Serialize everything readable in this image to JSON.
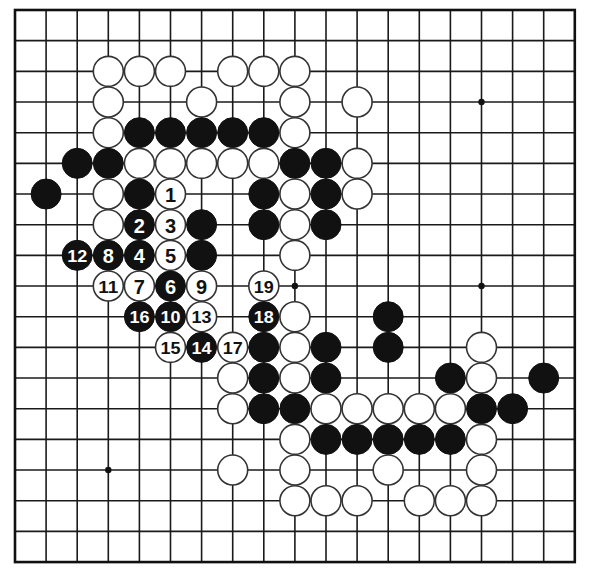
{
  "board": {
    "size": 19,
    "origin_x": 15,
    "origin_y": 10,
    "spacing_x": 31.1,
    "spacing_y": 30.67,
    "stone_radius": 15,
    "colors": {
      "black": "#111111",
      "white": "#ffffff",
      "line": "#1a1a1a",
      "background": "#ffffff"
    },
    "star_points": [
      [
        3,
        3
      ],
      [
        9,
        3
      ],
      [
        15,
        3
      ],
      [
        3,
        9
      ],
      [
        9,
        9
      ],
      [
        15,
        9
      ],
      [
        3,
        15
      ],
      [
        9,
        15
      ],
      [
        15,
        15
      ]
    ]
  },
  "stones": [
    {
      "c": 3,
      "r": 2,
      "color": "white"
    },
    {
      "c": 4,
      "r": 2,
      "color": "white"
    },
    {
      "c": 5,
      "r": 2,
      "color": "white"
    },
    {
      "c": 7,
      "r": 2,
      "color": "white"
    },
    {
      "c": 8,
      "r": 2,
      "color": "white"
    },
    {
      "c": 9,
      "r": 2,
      "color": "white"
    },
    {
      "c": 3,
      "r": 3,
      "color": "white"
    },
    {
      "c": 6,
      "r": 3,
      "color": "white"
    },
    {
      "c": 9,
      "r": 3,
      "color": "white"
    },
    {
      "c": 11,
      "r": 3,
      "color": "white"
    },
    {
      "c": 3,
      "r": 4,
      "color": "white"
    },
    {
      "c": 4,
      "r": 4,
      "color": "black"
    },
    {
      "c": 5,
      "r": 4,
      "color": "black"
    },
    {
      "c": 6,
      "r": 4,
      "color": "black"
    },
    {
      "c": 7,
      "r": 4,
      "color": "black"
    },
    {
      "c": 8,
      "r": 4,
      "color": "black"
    },
    {
      "c": 9,
      "r": 4,
      "color": "white"
    },
    {
      "c": 2,
      "r": 5,
      "color": "black"
    },
    {
      "c": 3,
      "r": 5,
      "color": "black"
    },
    {
      "c": 4,
      "r": 5,
      "color": "white"
    },
    {
      "c": 5,
      "r": 5,
      "color": "white"
    },
    {
      "c": 6,
      "r": 5,
      "color": "white"
    },
    {
      "c": 7,
      "r": 5,
      "color": "white"
    },
    {
      "c": 8,
      "r": 5,
      "color": "white"
    },
    {
      "c": 9,
      "r": 5,
      "color": "black"
    },
    {
      "c": 10,
      "r": 5,
      "color": "black"
    },
    {
      "c": 11,
      "r": 5,
      "color": "white"
    },
    {
      "c": 1,
      "r": 6,
      "color": "black"
    },
    {
      "c": 3,
      "r": 6,
      "color": "white"
    },
    {
      "c": 4,
      "r": 6,
      "color": "black"
    },
    {
      "c": 5,
      "r": 6,
      "color": "white",
      "label": "1"
    },
    {
      "c": 8,
      "r": 6,
      "color": "black"
    },
    {
      "c": 9,
      "r": 6,
      "color": "white"
    },
    {
      "c": 10,
      "r": 6,
      "color": "black"
    },
    {
      "c": 11,
      "r": 6,
      "color": "white"
    },
    {
      "c": 3,
      "r": 7,
      "color": "white"
    },
    {
      "c": 4,
      "r": 7,
      "color": "black",
      "label": "2"
    },
    {
      "c": 5,
      "r": 7,
      "color": "white",
      "label": "3"
    },
    {
      "c": 6,
      "r": 7,
      "color": "black"
    },
    {
      "c": 8,
      "r": 7,
      "color": "black"
    },
    {
      "c": 9,
      "r": 7,
      "color": "white"
    },
    {
      "c": 10,
      "r": 7,
      "color": "black"
    },
    {
      "c": 2,
      "r": 8,
      "color": "black",
      "label": "12"
    },
    {
      "c": 3,
      "r": 8,
      "color": "black",
      "label": "8"
    },
    {
      "c": 4,
      "r": 8,
      "color": "black",
      "label": "4"
    },
    {
      "c": 5,
      "r": 8,
      "color": "white",
      "label": "5"
    },
    {
      "c": 6,
      "r": 8,
      "color": "black"
    },
    {
      "c": 9,
      "r": 8,
      "color": "white"
    },
    {
      "c": 3,
      "r": 9,
      "color": "white",
      "label": "11"
    },
    {
      "c": 4,
      "r": 9,
      "color": "white",
      "label": "7"
    },
    {
      "c": 5,
      "r": 9,
      "color": "black",
      "label": "6"
    },
    {
      "c": 6,
      "r": 9,
      "color": "white",
      "label": "9"
    },
    {
      "c": 8,
      "r": 9,
      "color": "white",
      "label": "19"
    },
    {
      "c": 4,
      "r": 10,
      "color": "black",
      "label": "16"
    },
    {
      "c": 5,
      "r": 10,
      "color": "black",
      "label": "10"
    },
    {
      "c": 6,
      "r": 10,
      "color": "white",
      "label": "13"
    },
    {
      "c": 8,
      "r": 10,
      "color": "black",
      "label": "18"
    },
    {
      "c": 9,
      "r": 10,
      "color": "white"
    },
    {
      "c": 12,
      "r": 10,
      "color": "black"
    },
    {
      "c": 5,
      "r": 11,
      "color": "white",
      "label": "15"
    },
    {
      "c": 6,
      "r": 11,
      "color": "black",
      "label": "14"
    },
    {
      "c": 7,
      "r": 11,
      "color": "white",
      "label": "17"
    },
    {
      "c": 8,
      "r": 11,
      "color": "black"
    },
    {
      "c": 9,
      "r": 11,
      "color": "white"
    },
    {
      "c": 10,
      "r": 11,
      "color": "black"
    },
    {
      "c": 12,
      "r": 11,
      "color": "black"
    },
    {
      "c": 15,
      "r": 11,
      "color": "white"
    },
    {
      "c": 7,
      "r": 12,
      "color": "white"
    },
    {
      "c": 8,
      "r": 12,
      "color": "black"
    },
    {
      "c": 9,
      "r": 12,
      "color": "white"
    },
    {
      "c": 10,
      "r": 12,
      "color": "black"
    },
    {
      "c": 14,
      "r": 12,
      "color": "black"
    },
    {
      "c": 15,
      "r": 12,
      "color": "white"
    },
    {
      "c": 17,
      "r": 12,
      "color": "black"
    },
    {
      "c": 7,
      "r": 13,
      "color": "white"
    },
    {
      "c": 8,
      "r": 13,
      "color": "black"
    },
    {
      "c": 9,
      "r": 13,
      "color": "black"
    },
    {
      "c": 10,
      "r": 13,
      "color": "white"
    },
    {
      "c": 11,
      "r": 13,
      "color": "white"
    },
    {
      "c": 12,
      "r": 13,
      "color": "white"
    },
    {
      "c": 13,
      "r": 13,
      "color": "white"
    },
    {
      "c": 14,
      "r": 13,
      "color": "white"
    },
    {
      "c": 15,
      "r": 13,
      "color": "black"
    },
    {
      "c": 16,
      "r": 13,
      "color": "black"
    },
    {
      "c": 9,
      "r": 14,
      "color": "white"
    },
    {
      "c": 10,
      "r": 14,
      "color": "black"
    },
    {
      "c": 11,
      "r": 14,
      "color": "black"
    },
    {
      "c": 12,
      "r": 14,
      "color": "black"
    },
    {
      "c": 13,
      "r": 14,
      "color": "black"
    },
    {
      "c": 14,
      "r": 14,
      "color": "black"
    },
    {
      "c": 15,
      "r": 14,
      "color": "white"
    },
    {
      "c": 7,
      "r": 15,
      "color": "white"
    },
    {
      "c": 9,
      "r": 15,
      "color": "white"
    },
    {
      "c": 12,
      "r": 15,
      "color": "white"
    },
    {
      "c": 15,
      "r": 15,
      "color": "white"
    },
    {
      "c": 9,
      "r": 16,
      "color": "white"
    },
    {
      "c": 10,
      "r": 16,
      "color": "white"
    },
    {
      "c": 11,
      "r": 16,
      "color": "white"
    },
    {
      "c": 13,
      "r": 16,
      "color": "white"
    },
    {
      "c": 14,
      "r": 16,
      "color": "white"
    },
    {
      "c": 15,
      "r": 16,
      "color": "white"
    }
  ]
}
